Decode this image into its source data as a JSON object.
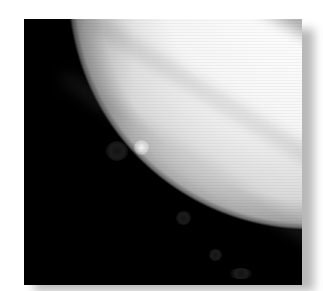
{
  "image": {
    "subject": "Grayscale photograph of Jupiter showing dark impact spots along the southern hemisphere",
    "style": "grayscale photograph with soft drop shadow on white background",
    "frame": {
      "left": 24,
      "top": 19,
      "width": 278,
      "height": 266
    },
    "colors": {
      "background": "#ffffff",
      "space": "#000000",
      "planet_bright": "#f6f6f6",
      "shadow": "#b0b0b0"
    },
    "features": {
      "dark_spots": [
        {
          "x": 116,
          "y": 151,
          "r": 9
        },
        {
          "x": 184,
          "y": 218,
          "r": 7
        },
        {
          "x": 216,
          "y": 255,
          "r": 6
        },
        {
          "x": 240,
          "y": 274,
          "r": 8
        }
      ],
      "bright_spots": [
        {
          "x": 142,
          "y": 148,
          "r": 7
        }
      ]
    }
  }
}
